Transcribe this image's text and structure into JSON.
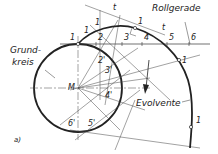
{
  "labels": {
    "roll_line": "Rollgerade",
    "base_circle_line1": "Grund-",
    "base_circle_line2": "kreis",
    "involute": "Evolvente",
    "center": "M",
    "tangent_a": "t",
    "tangent_b": "t",
    "figure": "a)"
  },
  "roll_points": [
    "1",
    "2",
    "3",
    "4",
    "5",
    "6"
  ],
  "circle_points": [
    "2'",
    "3'",
    "4'",
    "5'",
    "6'"
  ],
  "involute_points": [
    "1",
    "1",
    "1",
    "1",
    "1"
  ],
  "colors": {
    "line": "#222222",
    "background": "#ffffff"
  }
}
